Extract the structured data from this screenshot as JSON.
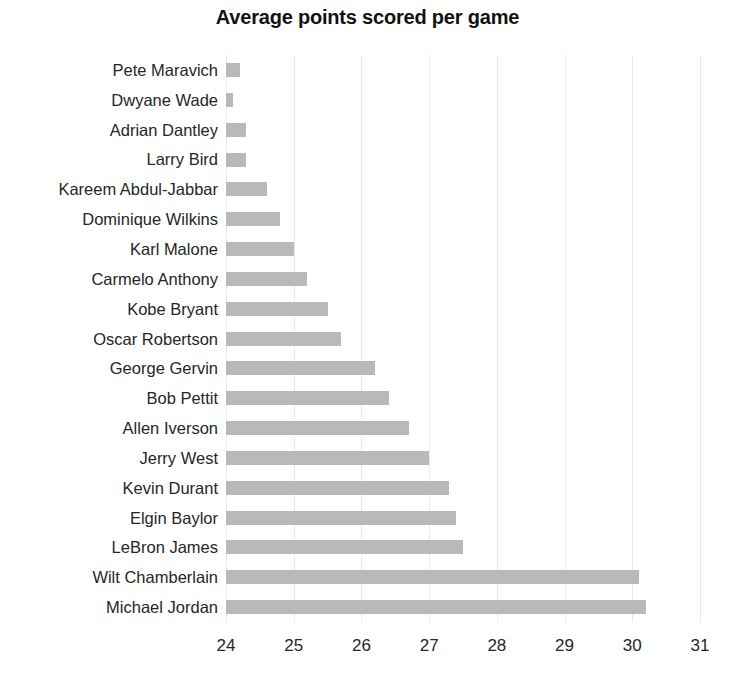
{
  "chart_data": {
    "type": "bar",
    "orientation": "horizontal",
    "title": "Average points scored per game",
    "xlabel": "",
    "ylabel": "",
    "xlim": [
      24,
      31
    ],
    "xticks": [
      24,
      25,
      26,
      27,
      28,
      29,
      30,
      31
    ],
    "xtick_labels": [
      "24",
      "25",
      "26",
      "27",
      "28",
      "29",
      "30",
      "31"
    ],
    "grid": true,
    "grid_axis": "x",
    "legend": false,
    "bar_color": "#b9b9b9",
    "background_color": "#ffffff",
    "title_color": "#121212",
    "gridline_color": "#e9e9e9",
    "categories": [
      "Pete Maravich",
      "Dwyane Wade",
      "Adrian Dantley",
      "Larry Bird",
      "Kareem Abdul-Jabbar",
      "Dominique Wilkins",
      "Karl Malone",
      "Carmelo Anthony",
      "Kobe Bryant",
      "Oscar Robertson",
      "George Gervin",
      "Bob Pettit",
      "Allen Iverson",
      "Jerry West",
      "Kevin Durant",
      "Elgin Baylor",
      "LeBron James",
      "Wilt Chamberlain",
      "Michael Jordan"
    ],
    "values": [
      24.2,
      24.1,
      24.3,
      24.3,
      24.6,
      24.8,
      25.0,
      25.2,
      25.5,
      25.7,
      26.2,
      26.4,
      26.7,
      27.0,
      27.3,
      27.4,
      27.5,
      30.1,
      30.2
    ]
  }
}
